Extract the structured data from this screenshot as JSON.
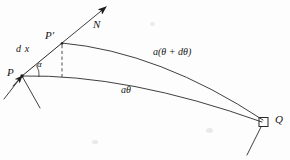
{
  "figure": {
    "background_color": "#fdfdfd",
    "ink_color": "#151515",
    "line_color": "#2a2a2a"
  },
  "labels": {
    "normal_vector": "N",
    "point_p_prime": "P′",
    "chord": "d x",
    "point_p": "P",
    "angle": "α",
    "upper_arc": "a(θ + dθ)",
    "lower_arc": "aθ",
    "point_q": "Q"
  },
  "geometry": {
    "point_p": {
      "x": 22,
      "y": 76
    },
    "point_p_prime": {
      "x": 62,
      "y": 43
    },
    "point_q": {
      "x": 263,
      "y": 122
    },
    "arrow_tip": {
      "x": 106,
      "y": 7
    },
    "square_marker": {
      "x": 259,
      "y": 118,
      "size": 9
    },
    "dashed_line": {
      "x": 62,
      "from_y": 45,
      "to_y": 79
    },
    "angle_arc_radius": 17
  }
}
